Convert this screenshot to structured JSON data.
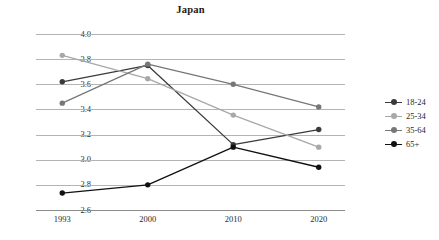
{
  "chart_data": {
    "type": "line",
    "title": "Japan",
    "xlabel": "",
    "ylabel": "",
    "categories": [
      "1993",
      "2000",
      "2010",
      "2020"
    ],
    "ylim": [
      2.6,
      4.0
    ],
    "yticks": [
      "4.0",
      "3.8",
      "3.6",
      "3.4",
      "3.2",
      "3.0",
      "2.8",
      "2.6"
    ],
    "ytick_values": [
      4.0,
      3.8,
      3.6,
      3.4,
      3.2,
      3.0,
      2.8,
      2.6
    ],
    "grid": "horizontal",
    "legend_position": "right",
    "series": [
      {
        "name": "18-24",
        "color": "#3a3a3a",
        "values": [
          3.62,
          3.75,
          3.12,
          3.24
        ]
      },
      {
        "name": "25-34",
        "color": "#a8a8a8",
        "values": [
          3.83,
          3.645,
          3.355,
          3.1
        ]
      },
      {
        "name": "35-64",
        "color": "#777777",
        "values": [
          3.45,
          3.76,
          3.6,
          3.42
        ]
      },
      {
        "name": "65+",
        "color": "#111111",
        "values": [
          2.735,
          2.8,
          3.1,
          2.94
        ]
      }
    ]
  },
  "legend": {
    "items": [
      {
        "label": "18-24",
        "color": "#3a3a3a"
      },
      {
        "label": "25-34",
        "color": "#a8a8a8"
      },
      {
        "label": "35-64",
        "color": "#777777"
      },
      {
        "label": "65+",
        "color": "#111111"
      }
    ]
  },
  "colors": {
    "gridline": "#b4b4b4",
    "axis": "#8c8c8c",
    "text": "#2b2b2b",
    "background": "#ffffff"
  }
}
